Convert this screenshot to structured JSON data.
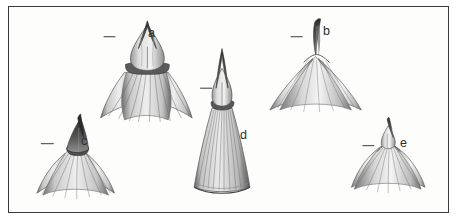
{
  "plate": {
    "background_color": "#ffffff",
    "panel_color": "#fdfdfc",
    "frame_color": "#3a3a3a",
    "ink_color": "#3b3b3b",
    "label_color": "#2e2e2e",
    "medium": "grayscale pencil and ink scientific illustration",
    "subject": "five specimen apex drawings arranged in two rows"
  },
  "specimens": [
    {
      "id": "a",
      "label": "a",
      "description": "bulbous ovoid body with sharp pointed apex and broad fibrous flared skirt",
      "scale_bar": "–"
    },
    {
      "id": "b",
      "label": "b",
      "description": "slender curved spike apex on a broad triangular conical base",
      "scale_bar": "–"
    },
    {
      "id": "c",
      "label": "c",
      "description": "dark triangular pointed apex above a wide spreading fibrous skirt",
      "scale_bar": "–"
    },
    {
      "id": "d",
      "label": "d",
      "description": "tall narrow elongated form with fine longitudinal striations and rounded base",
      "scale_bar": "–"
    },
    {
      "id": "e",
      "label": "e",
      "description": "small bulbous tip above a broad rounded dome with radiating fibres",
      "scale_bar": "–"
    }
  ]
}
